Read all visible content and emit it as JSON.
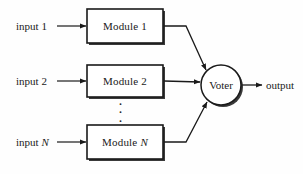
{
  "diagram": {
    "type": "block-diagram",
    "background_color": "#fefefe",
    "stroke_color": "#1a1a1a",
    "shadow_color": "#3a3a3a",
    "inputs": [
      {
        "label_prefix": "input",
        "label_suffix": "1",
        "suffix_italic": false
      },
      {
        "label_prefix": "input",
        "label_suffix": "2",
        "suffix_italic": false
      },
      {
        "label_prefix": "input",
        "label_suffix": "N",
        "suffix_italic": true
      }
    ],
    "modules": [
      {
        "label_prefix": "Module",
        "label_suffix": "1",
        "suffix_italic": false
      },
      {
        "label_prefix": "Module",
        "label_suffix": "2",
        "suffix_italic": false
      },
      {
        "label_prefix": "Module",
        "label_suffix": "N",
        "suffix_italic": true
      }
    ],
    "voter": {
      "label": "Voter"
    },
    "output": {
      "label": "output"
    },
    "ellipsis": {
      "label": "⋮",
      "dots": 3
    }
  }
}
